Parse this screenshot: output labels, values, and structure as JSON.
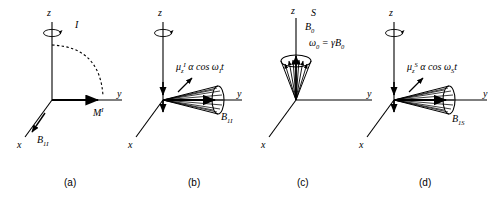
{
  "figure": {
    "type": "physics-vector-diagram",
    "background": "#ffffff",
    "stroke_color": "#000000",
    "panels": [
      {
        "id": "a",
        "caption": "(a)",
        "axes": {
          "z": "z",
          "y": "y",
          "x": "x"
        },
        "labels": {
          "precession": "I",
          "magnetization": "M",
          "magnetization_sup": "I",
          "field": "B",
          "field_sub": "1I"
        },
        "features": [
          "z-axis-precession-arc",
          "dashed-arc-z-to-y",
          "magnetization-vector-along-y",
          "B1I-arrow-toward-origin"
        ]
      },
      {
        "id": "b",
        "caption": "(b)",
        "axes": {
          "z": "z",
          "y": "y",
          "x": "x"
        },
        "labels": {
          "expression": "μ",
          "expression_sub": "z",
          "expression_sup": "I",
          "expression_rest": "α cos ω",
          "expression_omega_sub": "I",
          "expression_tail": "t",
          "field": "B",
          "field_sub": "1I"
        },
        "features": [
          "z-axis-precession-arc",
          "horizontal-cone-along-y",
          "spin-fan-lines",
          "down-arrows-on-z"
        ]
      },
      {
        "id": "c",
        "caption": "(c)",
        "axes": {
          "z": "z",
          "y": "y",
          "x": "x"
        },
        "labels": {
          "spin": "S",
          "field": "B",
          "field_sub": "0",
          "larmor": "ω",
          "larmor_sub": "0",
          "larmor_eq": "= γB",
          "larmor_eq_sub": "0"
        },
        "features": [
          "vertical-cone-along-z",
          "spin-fan-lines",
          "up-arrows-along-z"
        ]
      },
      {
        "id": "d",
        "caption": "(d)",
        "axes": {
          "z": "z",
          "y": "y",
          "x": "x"
        },
        "labels": {
          "expression": "μ",
          "expression_sub": "z",
          "expression_sup": "S",
          "expression_rest": "α cos ω",
          "expression_omega_sub": "S",
          "expression_tail": "t",
          "field": "B",
          "field_sub": "1S"
        },
        "features": [
          "z-axis-precession-arc",
          "horizontal-cone-along-y",
          "spin-fan-lines",
          "down-arrows-on-z"
        ]
      }
    ]
  }
}
